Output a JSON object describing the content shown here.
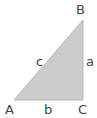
{
  "diagram": {
    "type": "right-triangle",
    "fill_color": "#cccccc",
    "edge_color": "#b5b5b5",
    "label_color": "#444444",
    "vertices": [
      {
        "name": "A",
        "x": 14,
        "y": 100
      },
      {
        "name": "B",
        "x": 83,
        "y": 20
      },
      {
        "name": "C",
        "x": 83,
        "y": 100
      }
    ],
    "labels": {
      "A": "A",
      "B": "B",
      "C": "C",
      "a": "a",
      "b": "b",
      "c": "c"
    }
  }
}
